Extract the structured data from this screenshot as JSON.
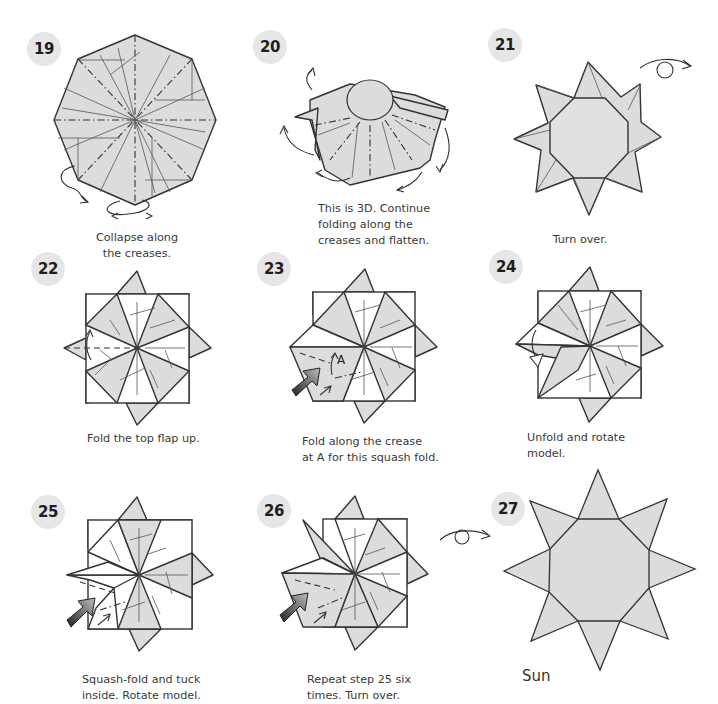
{
  "page": {
    "colors": {
      "paper_fill": "#dcdcdc",
      "outline": "#333333",
      "badge_bg": "#e6e6e6",
      "badge_text": "#1e1e1e",
      "text": "#3a3a3a"
    }
  },
  "steps": [
    {
      "number": "19",
      "caption": "Collapse along\nthe creases.",
      "icons": [
        "octagon-crease-pattern",
        "curved-arrow"
      ]
    },
    {
      "number": "20",
      "caption": "This is 3D. Continue\nfolding along the\ncreases and flatten.",
      "icons": [
        "3d-collapse-diagram",
        "curved-arrow"
      ]
    },
    {
      "number": "21",
      "caption": "Turn over.",
      "icons": [
        "eight-point-star-diagram",
        "turn-over-arrow"
      ]
    },
    {
      "number": "22",
      "caption": "Fold the top flap up.",
      "icons": [
        "pinwheel-diagram",
        "valley-fold-arrow"
      ]
    },
    {
      "number": "23",
      "caption": "Fold along the crease\nat A for this squash fold.",
      "label_a": "A",
      "icons": [
        "pinwheel-diagram",
        "squash-push-arrow"
      ]
    },
    {
      "number": "24",
      "caption": "Unfold and rotate model.",
      "icons": [
        "pinwheel-diagram",
        "unfold-arrow"
      ]
    },
    {
      "number": "25",
      "caption": "Squash-fold and tuck\ninside. Rotate model.",
      "icons": [
        "pinwheel-diagram",
        "squash-push-arrow"
      ]
    },
    {
      "number": "26",
      "caption": "Repeat step 25 six\ntimes. Turn over.",
      "icons": [
        "pinwheel-diagram",
        "squash-push-arrow",
        "turn-over-arrow"
      ]
    },
    {
      "number": "27",
      "caption": "Sun",
      "icons": [
        "finished-sun-star"
      ]
    }
  ]
}
